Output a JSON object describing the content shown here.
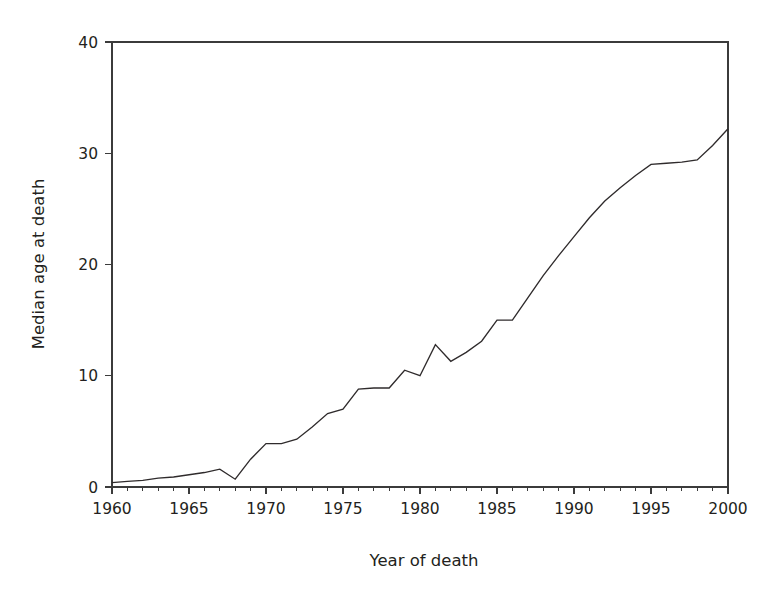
{
  "chart_data": {
    "type": "line",
    "title": "",
    "xlabel": "Year  of death",
    "ylabel": "Median age at death",
    "xlim": [
      1960,
      2000
    ],
    "ylim": [
      0,
      40
    ],
    "xticks": [
      1960,
      1965,
      1970,
      1975,
      1980,
      1985,
      1990,
      1995,
      2000
    ],
    "yticks": [
      0,
      10,
      20,
      30,
      40
    ],
    "grid": false,
    "legend": "none",
    "series": [
      {
        "name": "Median age at death",
        "x": [
          1960,
          1961,
          1962,
          1963,
          1964,
          1965,
          1966,
          1967,
          1968,
          1969,
          1970,
          1971,
          1972,
          1973,
          1974,
          1975,
          1976,
          1977,
          1978,
          1979,
          1980,
          1981,
          1982,
          1983,
          1984,
          1985,
          1986,
          1987,
          1988,
          1989,
          1990,
          1991,
          1992,
          1993,
          1994,
          1995,
          1996,
          1997,
          1998,
          1999,
          2000
        ],
        "values": [
          0.4,
          0.5,
          0.6,
          0.8,
          0.9,
          1.1,
          1.3,
          1.6,
          0.7,
          2.5,
          3.9,
          3.9,
          4.3,
          5.4,
          6.6,
          7.0,
          8.8,
          8.9,
          8.9,
          10.5,
          10.0,
          12.8,
          11.3,
          12.1,
          13.1,
          15.0,
          15.0,
          17.0,
          19.0,
          20.8,
          22.5,
          24.2,
          25.7,
          26.9,
          28.0,
          29.0,
          29.1,
          29.2,
          29.4,
          30.7,
          32.2
        ]
      }
    ]
  },
  "axes": {
    "x_title": "Year  of death",
    "y_title": "Median age at death",
    "x_tick_labels": [
      "1960",
      "1965",
      "1970",
      "1975",
      "1980",
      "1985",
      "1990",
      "1995",
      "2000"
    ],
    "y_tick_labels": [
      "0",
      "10",
      "20",
      "30",
      "40"
    ]
  },
  "colors": {
    "line": "#2f2b2c",
    "axis": "#3b3b3b",
    "text": "#231f20",
    "background": "#ffffff"
  }
}
